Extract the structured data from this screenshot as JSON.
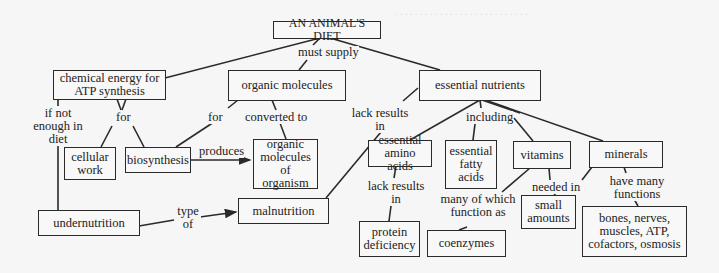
{
  "diagram": {
    "type": "concept-map",
    "root": {
      "label": "AN ANIMAL'S DIET"
    },
    "nodes": {
      "chemical_energy": "chemical energy for ATP synthesis",
      "organic_molecules": "organic molecules",
      "essential_nutrients": "essential nutrients",
      "cellular_work": "cellular work",
      "biosynthesis": "biosynthesis",
      "organic_molecules_of_organism": "organic molecules of organism",
      "undernutrition": "undernutrition",
      "malnutrition": "malnutrition",
      "essential_amino_acids": "essential amino acids",
      "essential_fatty_acids": "essential fatty acids",
      "vitamins": "vitamins",
      "minerals": "minerals",
      "protein_deficiency": "protein deficiency",
      "coenzymes": "coenzymes",
      "small_amounts": "small amounts",
      "mineral_functions": "bones, nerves, muscles, ATP, cofactors, osmosis"
    },
    "links": {
      "must_supply": "must supply",
      "if_not_enough": "if not enough in diet",
      "for_energy": "for",
      "for_organic": "for",
      "converted_to": "converted to",
      "produces": "produces",
      "type_of": "type of",
      "lack_results_in_nutrients": "lack results in",
      "including": "including",
      "lack_results_in_amino": "lack results in",
      "many_of_which": "many of which function as",
      "needed_in": "needed in",
      "have_many_functions": "have many functions"
    },
    "edges": [
      {
        "from": "root",
        "to": "chemical_energy",
        "label": "must supply"
      },
      {
        "from": "root",
        "to": "organic_molecules",
        "label": "must supply"
      },
      {
        "from": "root",
        "to": "essential_nutrients",
        "label": "must supply"
      },
      {
        "from": "chemical_energy",
        "to": "cellular_work",
        "label": "for"
      },
      {
        "from": "chemical_energy",
        "to": "biosynthesis",
        "label": "for"
      },
      {
        "from": "chemical_energy",
        "to": "undernutrition",
        "label": "if not enough in diet"
      },
      {
        "from": "organic_molecules",
        "to": "biosynthesis",
        "label": "for"
      },
      {
        "from": "organic_molecules",
        "to": "organic_molecules_of_organism",
        "label": "converted to"
      },
      {
        "from": "biosynthesis",
        "to": "organic_molecules_of_organism",
        "label": "produces"
      },
      {
        "from": "undernutrition",
        "to": "malnutrition",
        "label": "type of"
      },
      {
        "from": "essential_nutrients",
        "to": "malnutrition",
        "label": "lack results in"
      },
      {
        "from": "essential_nutrients",
        "to": "essential_amino_acids",
        "label": "including"
      },
      {
        "from": "essential_nutrients",
        "to": "essential_fatty_acids",
        "label": "including"
      },
      {
        "from": "essential_nutrients",
        "to": "vitamins",
        "label": "including"
      },
      {
        "from": "essential_nutrients",
        "to": "minerals",
        "label": "including"
      },
      {
        "from": "essential_amino_acids",
        "to": "protein_deficiency",
        "label": "lack results in"
      },
      {
        "from": "vitamins",
        "to": "coenzymes",
        "label": "many of which function as"
      },
      {
        "from": "vitamins",
        "to": "small_amounts",
        "label": "needed in"
      },
      {
        "from": "minerals",
        "to": "small_amounts",
        "label": "needed in"
      },
      {
        "from": "minerals",
        "to": "mineral_functions",
        "label": "have many functions"
      }
    ]
  },
  "colors": {
    "line": "#2a2a2a",
    "background": "#f6f6f6",
    "text": "#222222"
  }
}
